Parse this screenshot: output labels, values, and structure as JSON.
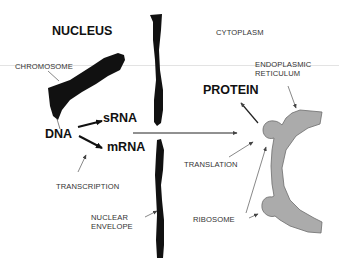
{
  "diagram": {
    "type": "biology-schematic",
    "regions": {
      "nucleus": "NUCLEUS",
      "cytoplasm": "CYTOPLASM"
    },
    "molecules": {
      "dna": "DNA",
      "srna": "sRNA",
      "mrna": "mRNA",
      "protein": "PROTEIN"
    },
    "labels": {
      "chromosome": "CHROMOSOME",
      "transcription": "TRANSCRIPTION",
      "nuclear_envelope_line1": "NUCLEAR",
      "nuclear_envelope_line2": "ENVELOPE",
      "er_line1": "ENDOPLASMIC",
      "er_line2": "RETICULUM",
      "translation": "TRANSLATION",
      "ribosome": "RIBOSOME"
    },
    "colors": {
      "structure_dark": "#111111",
      "er_fill": "#a9a9a9",
      "er_stroke": "#6e6e6e",
      "divider_line": "#d8d8d8",
      "arrow": "#222222",
      "pointer": "#555555"
    }
  }
}
